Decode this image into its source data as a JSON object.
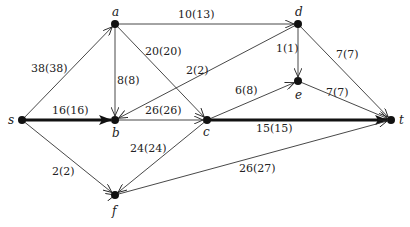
{
  "diagram": {
    "type": "flow-network",
    "nodes": [
      {
        "id": "s",
        "label": "s",
        "x": 22,
        "y": 120
      },
      {
        "id": "a",
        "label": "a",
        "x": 115,
        "y": 24
      },
      {
        "id": "b",
        "label": "b",
        "x": 115,
        "y": 120
      },
      {
        "id": "c",
        "label": "c",
        "x": 207,
        "y": 120
      },
      {
        "id": "d",
        "label": "d",
        "x": 298,
        "y": 24
      },
      {
        "id": "e",
        "label": "e",
        "x": 298,
        "y": 81
      },
      {
        "id": "f",
        "label": "f",
        "x": 115,
        "y": 195
      },
      {
        "id": "t",
        "label": "t",
        "x": 391,
        "y": 120
      }
    ],
    "edges": [
      {
        "from": "s",
        "to": "a",
        "label": "38(38)",
        "bold": false
      },
      {
        "from": "s",
        "to": "b",
        "label": "16(16)",
        "bold": true
      },
      {
        "from": "s",
        "to": "f",
        "label": "2(2)",
        "bold": false
      },
      {
        "from": "a",
        "to": "d",
        "label": "10(13)",
        "bold": false
      },
      {
        "from": "a",
        "to": "b",
        "label": "8(8)",
        "bold": false
      },
      {
        "from": "a",
        "to": "c",
        "label": "20(20)",
        "bold": false
      },
      {
        "from": "d",
        "to": "b",
        "label": "2(2)",
        "bold": false
      },
      {
        "from": "b",
        "to": "c",
        "label": "26(26)",
        "bold": false
      },
      {
        "from": "d",
        "to": "e",
        "label": "1(1)",
        "bold": false
      },
      {
        "from": "d",
        "to": "t",
        "label": "7(7)",
        "bold": false
      },
      {
        "from": "c",
        "to": "e",
        "label": "6(8)",
        "bold": false
      },
      {
        "from": "e",
        "to": "t",
        "label": "7(7)",
        "bold": false
      },
      {
        "from": "c",
        "to": "t",
        "label": "15(15)",
        "bold": true
      },
      {
        "from": "c",
        "to": "f",
        "label": "24(24)",
        "bold": false
      },
      {
        "from": "f",
        "to": "t",
        "label": "26(27)",
        "bold": false
      }
    ]
  }
}
